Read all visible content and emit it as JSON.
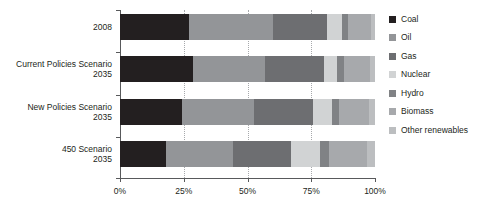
{
  "chart_data": {
    "type": "bar",
    "subtype": "stacked-horizontal-100pct",
    "title": "",
    "xlabel": "",
    "ylabel": "",
    "xlim": [
      0,
      100
    ],
    "xticks": [
      0,
      25,
      50,
      75,
      100
    ],
    "xtick_labels": [
      "0%",
      "25%",
      "50%",
      "75%",
      "100%"
    ],
    "grid": "vertical-dotted",
    "legend_position": "right",
    "categories": [
      {
        "line1": "",
        "line2": "2008"
      },
      {
        "line1": "Current Policies Scenario",
        "line2": "2035"
      },
      {
        "line1": "New Policies Scenario",
        "line2": "2035"
      },
      {
        "line1": "450 Scenario",
        "line2": "2035"
      }
    ],
    "category_labels": [
      "2008",
      "Current Policies Scenario 2035",
      "New Policies Scenario 2035",
      "450 Scenario 2035"
    ],
    "series": [
      {
        "name": "Coal",
        "color": "#231f20",
        "values": [
          27.0,
          28.5,
          24.5,
          18.0
        ]
      },
      {
        "name": "Oil",
        "color": "#939598",
        "values": [
          33.0,
          28.5,
          28.0,
          26.5
        ]
      },
      {
        "name": "Gas",
        "color": "#6d6e71",
        "values": [
          21.0,
          23.0,
          23.0,
          22.5
        ]
      },
      {
        "name": "Nuclear",
        "color": "#d1d3d4",
        "values": [
          6.0,
          5.0,
          7.5,
          11.5
        ]
      },
      {
        "name": "Hydro",
        "color": "#808285",
        "values": [
          2.5,
          3.0,
          3.0,
          3.5
        ]
      },
      {
        "name": "Biomass",
        "color": "#a7a9ac",
        "values": [
          9.0,
          10.0,
          11.5,
          15.0
        ]
      },
      {
        "name": "Other renewables",
        "color": "#bcbec0",
        "values": [
          1.5,
          2.0,
          2.5,
          3.0
        ]
      }
    ]
  },
  "legend": {
    "items": [
      {
        "label": "Coal",
        "color": "#231f20"
      },
      {
        "label": "Oil",
        "color": "#939598"
      },
      {
        "label": "Gas",
        "color": "#6d6e71"
      },
      {
        "label": "Nuclear",
        "color": "#d1d3d4"
      },
      {
        "label": "Hydro",
        "color": "#808285"
      },
      {
        "label": "Biomass",
        "color": "#a7a9ac"
      },
      {
        "label": "Other renewables",
        "color": "#bcbec0"
      }
    ]
  },
  "axis": {
    "tick_labels": [
      "0%",
      "25%",
      "50%",
      "75%",
      "100%"
    ]
  }
}
